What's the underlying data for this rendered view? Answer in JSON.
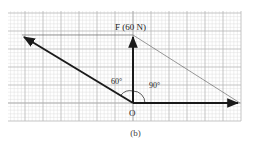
{
  "figure": {
    "caption": "(b)",
    "force_label": "F (60 N)",
    "origin_label": "O",
    "angle_left_label": "60°",
    "angle_right_label": "90°"
  },
  "colors": {
    "grid_minor": "#d8d8d8",
    "grid_major": "#b0b0b0",
    "vector": "#1a1a1a",
    "construction_line": "#555555"
  },
  "geometry": {
    "grid": {
      "x0": 8,
      "y0": 11,
      "x1": 241,
      "y1": 121,
      "major": 18,
      "minor": 3.6
    },
    "origin": [
      133,
      103
    ],
    "vector_up_tip": [
      133,
      35
    ],
    "vector_right_tip": [
      240,
      103
    ],
    "vector_diag_tip": [
      22,
      36
    ]
  }
}
